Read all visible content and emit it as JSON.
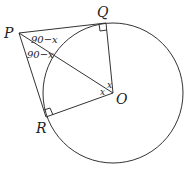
{
  "diagram": {
    "points": {
      "P": {
        "label": "P",
        "x": 19,
        "y": 33
      },
      "Q": {
        "label": "Q",
        "x": 106,
        "y": 23
      },
      "R": {
        "label": "R",
        "x": 46,
        "y": 117
      },
      "O": {
        "label": "O",
        "x": 113,
        "y": 93
      }
    },
    "circle": {
      "center": "O",
      "radius": 70
    },
    "angles": {
      "QPO": "90−x",
      "OPR": "90−x",
      "POQ": "x",
      "POR": "x"
    },
    "right_angles": [
      "Q",
      "R"
    ]
  }
}
